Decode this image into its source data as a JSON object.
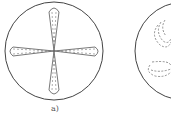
{
  "figure": {
    "panels": [
      {
        "id": "a",
        "label": "a)",
        "description": "circle with four dashed lobes in a cross pattern"
      },
      {
        "id": "b",
        "label": "",
        "description": "partially visible circle with dashed swirl patterns"
      }
    ],
    "colors": {
      "stroke": "#444444",
      "dash": "#666666",
      "background": "#ffffff"
    }
  }
}
